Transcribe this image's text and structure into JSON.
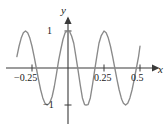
{
  "figure": {
    "axis_labels": {
      "x": "x",
      "y": "y"
    },
    "line_color": "#8a8a8a",
    "axis_color": "#3a3a3a",
    "background": "#ffffff"
  },
  "ticks": {
    "x": [
      {
        "value": -0.25,
        "label": "−0.25"
      },
      {
        "value": 0.25,
        "label": "0.25"
      },
      {
        "value": 0.5,
        "label": "0.5"
      }
    ],
    "y": [
      {
        "value": 1,
        "label": "1"
      },
      {
        "value": -1,
        "label": "−1"
      }
    ]
  },
  "chart_data": {
    "type": "line",
    "title": "",
    "xlabel": "x",
    "ylabel": "y",
    "xlim": [
      -0.375,
      0.5625
    ],
    "ylim": [
      -1.12,
      1.12
    ],
    "grid": false,
    "legend": null,
    "series": [
      {
        "name": "y = -cos(4πx)",
        "x": [
          -0.355,
          -0.34,
          -0.325,
          -0.31,
          -0.295,
          -0.28,
          -0.265,
          -0.25,
          -0.235,
          -0.22,
          -0.205,
          -0.19,
          -0.175,
          -0.16,
          -0.145,
          -0.13,
          -0.125,
          -0.11,
          -0.095,
          -0.08,
          -0.065,
          -0.05,
          -0.035,
          -0.02,
          -0.005,
          0.0,
          0.01,
          0.025,
          0.04,
          0.055,
          0.07,
          0.085,
          0.1,
          0.115,
          0.125,
          0.14,
          0.155,
          0.17,
          0.185,
          0.2,
          0.215,
          0.23,
          0.25,
          0.265,
          0.28,
          0.295,
          0.31,
          0.325,
          0.34,
          0.355,
          0.37,
          0.375,
          0.385,
          0.4,
          0.415,
          0.43,
          0.445,
          0.46,
          0.475,
          0.49,
          0.5
        ],
        "y": [
          0.309,
          0.5878,
          0.809,
          0.9511,
          1.0,
          0.9511,
          0.809,
          0.5878,
          0.309,
          0.0,
          -0.309,
          -0.5878,
          -0.809,
          -0.9511,
          -1.0,
          -0.9511,
          -0.9239,
          -0.7705,
          -0.5,
          -0.1564,
          0.2079,
          0.5,
          0.7705,
          0.9511,
          0.9996,
          1.0,
          0.9921,
          0.866,
          0.6691,
          0.309,
          -0.0628,
          -0.454,
          -0.809,
          -0.9877,
          -1.0,
          -0.9877,
          -0.809,
          -0.454,
          -0.0628,
          0.309,
          0.6691,
          0.866,
          1.0,
          0.9511,
          0.809,
          0.5878,
          0.309,
          0.0,
          -0.309,
          -0.5878,
          -0.809,
          -0.866,
          -0.9511,
          -1.0,
          -0.9511,
          -0.809,
          -0.5878,
          -0.309,
          0.0,
          0.309,
          0.5878
        ],
        "color": "#8a8a8a"
      }
    ],
    "annotations": [],
    "zero_crossings": [
      -0.22,
      -0.125,
      0.125,
      0.375,
      0.475
    ],
    "minima": [
      {
        "x": 0.0,
        "y": -1
      },
      {
        "x": -0.145,
        "y": -1
      },
      {
        "x": 0.125,
        "y": -1
      }
    ],
    "maxima": [
      {
        "x": 0.25,
        "y": 1
      },
      {
        "x": -0.295,
        "y": 1
      }
    ]
  }
}
